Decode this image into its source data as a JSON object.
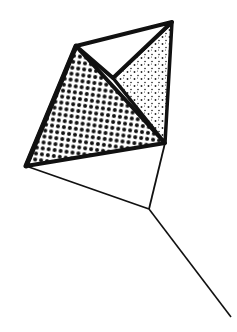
{
  "figure": {
    "colors": {
      "background": "#ffffff",
      "stroke": "#111111",
      "dot_fill": "#111111"
    },
    "vertices": {
      "top_left": [
        76,
        46
      ],
      "top_right": [
        172,
        22
      ],
      "inner": [
        113,
        78
      ],
      "left": [
        26,
        166
      ],
      "right": [
        165,
        143
      ],
      "junction": [
        149,
        209
      ],
      "tail_end": [
        231,
        317
      ]
    },
    "faces": [
      {
        "name": "large-triangle",
        "pattern": "coarse-dots"
      },
      {
        "name": "right-triangle",
        "pattern": "fine-stipple"
      },
      {
        "name": "top-triangle",
        "pattern": "blank"
      }
    ]
  }
}
